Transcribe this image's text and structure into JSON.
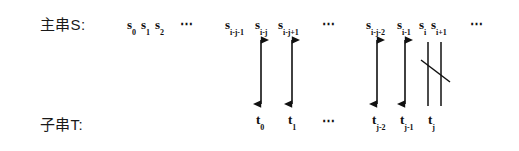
{
  "figure": {
    "kind": "string-matching-alignment-diagram",
    "rows": {
      "main_string": {
        "label": "主串S:",
        "tokens": [
          {
            "base": "s",
            "sub": "0",
            "x": 127,
            "y": 18
          },
          {
            "base": "s",
            "sub": "1",
            "x": 141,
            "y": 18
          },
          {
            "base": "s",
            "sub": "2",
            "x": 155,
            "y": 18
          },
          {
            "base": "s",
            "sub": "i-j-1",
            "x": 225,
            "y": 18
          },
          {
            "base": "s",
            "sub": "i-j",
            "x": 255,
            "y": 18
          },
          {
            "base": "s",
            "sub": "i-j+1",
            "x": 278,
            "y": 18
          },
          {
            "base": "s",
            "sub": "i-j-2",
            "x": 366,
            "y": 18
          },
          {
            "base": "s",
            "sub": "i-1",
            "x": 397,
            "y": 18
          },
          {
            "base": "s",
            "sub": "i",
            "x": 419,
            "y": 18
          },
          {
            "base": "s",
            "sub": "i+1",
            "x": 431,
            "y": 18
          }
        ],
        "ellipses": [
          {
            "text": "⋯",
            "x": 180,
            "y": 17
          },
          {
            "text": "⋯",
            "x": 322,
            "y": 17
          },
          {
            "text": "⋯",
            "x": 470,
            "y": 17
          }
        ]
      },
      "pattern_string": {
        "label": "子串T:",
        "tokens": [
          {
            "base": "t",
            "sub": "0",
            "x": 256,
            "y": 113
          },
          {
            "base": "t",
            "sub": "1",
            "x": 288,
            "y": 113
          },
          {
            "base": "t",
            "sub": "j-2",
            "x": 372,
            "y": 113
          },
          {
            "base": "t",
            "sub": "j-1",
            "x": 400,
            "y": 113
          },
          {
            "base": "t",
            "sub": "j",
            "x": 428,
            "y": 113
          }
        ],
        "ellipses": [
          {
            "text": "⋯",
            "x": 322,
            "y": 114
          }
        ]
      }
    },
    "connectors": {
      "match_arrows": [
        {
          "name": "match-arrow-1",
          "x": 261,
          "y_top": 40,
          "y_bottom": 104
        },
        {
          "name": "match-arrow-2",
          "x": 292,
          "y_top": 40,
          "y_bottom": 104
        },
        {
          "name": "match-arrow-3",
          "x": 377,
          "y_top": 40,
          "y_bottom": 104
        },
        {
          "name": "match-arrow-4",
          "x": 405,
          "y_top": 40,
          "y_bottom": 104
        }
      ],
      "mismatch_lines": [
        {
          "name": "mismatch-line-left",
          "x": 428,
          "y_top": 42,
          "y_bottom": 106
        },
        {
          "name": "mismatch-line-right",
          "x": 441,
          "y_top": 42,
          "y_bottom": 106
        }
      ],
      "mismatch_slash": {
        "name": "mismatch-slash",
        "x1": 421,
        "y1": 60,
        "x2": 450,
        "y2": 82
      }
    },
    "style": {
      "stroke_color": "#111111",
      "background_color": "#ffffff"
    }
  }
}
